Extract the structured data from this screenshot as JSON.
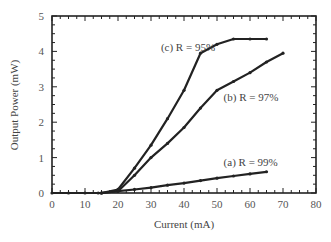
{
  "chart_data": {
    "type": "line",
    "title": "",
    "xlabel": "Current (mA)",
    "ylabel": "Output Power (mW)",
    "xlim": [
      0,
      80
    ],
    "ylim": [
      0,
      5
    ],
    "xticks": [
      0,
      10,
      20,
      30,
      40,
      50,
      60,
      70,
      80
    ],
    "yticks": [
      0,
      1,
      2,
      3,
      4,
      5
    ],
    "grid": false,
    "legend": "inline annotations",
    "series": [
      {
        "name": "(a) R = 99%",
        "x": [
          0,
          5,
          10,
          14,
          15,
          20,
          25,
          30,
          35,
          40,
          45,
          50,
          55,
          60,
          65
        ],
        "y": [
          0,
          0,
          0,
          0,
          0,
          0.05,
          0.1,
          0.15,
          0.22,
          0.28,
          0.35,
          0.42,
          0.48,
          0.54,
          0.6
        ]
      },
      {
        "name": "(b) R = 97%",
        "x": [
          15,
          20,
          25,
          30,
          35,
          40,
          45,
          50,
          55,
          60,
          65,
          70
        ],
        "y": [
          0,
          0.05,
          0.5,
          1.0,
          1.4,
          1.85,
          2.4,
          2.9,
          3.15,
          3.4,
          3.7,
          3.95
        ]
      },
      {
        "name": "(c) R = 95%",
        "x": [
          15,
          20,
          25,
          30,
          35,
          40,
          45,
          50,
          55,
          60,
          65
        ],
        "y": [
          0,
          0.1,
          0.7,
          1.35,
          2.1,
          2.9,
          3.95,
          4.2,
          4.35,
          4.35,
          4.35
        ]
      }
    ],
    "annotations": [
      {
        "text": "(c) R = 95%",
        "x": 33,
        "y": 4.0
      },
      {
        "text": "(b) R = 97%",
        "x": 52,
        "y": 2.6
      },
      {
        "text": "(a) R = 99%",
        "x": 52,
        "y": 0.75
      }
    ]
  }
}
